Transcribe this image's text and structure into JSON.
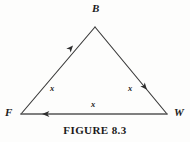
{
  "figure": {
    "caption": "FIGURE 8.3",
    "background_color": "#fdfdfc",
    "stroke_color": "#3a3a3a",
    "text_color": "#1b1b1b"
  },
  "diagram": {
    "type": "geometry-triangle",
    "shape": "isosceles triangle with directed sides",
    "vertices": [
      {
        "id": "B",
        "label": "B",
        "x": 95,
        "y": 27
      },
      {
        "id": "F",
        "label": "F",
        "x": 21,
        "y": 114
      },
      {
        "id": "W",
        "label": "W",
        "x": 167,
        "y": 114
      }
    ],
    "sides": [
      {
        "id": "FB",
        "from": "F",
        "to": "B",
        "label": "x",
        "arrow_direction": "toward-B",
        "arrow_x": 73,
        "arrow_y": 45
      },
      {
        "id": "BW",
        "from": "B",
        "to": "W",
        "label": "x",
        "arrow_direction": "toward-W",
        "arrow_x": 147,
        "arrow_y": 99
      },
      {
        "id": "FW",
        "from": "W",
        "to": "F",
        "label": "x",
        "arrow_direction": "toward-F",
        "arrow_x": 49,
        "arrow_y": 114
      }
    ]
  }
}
